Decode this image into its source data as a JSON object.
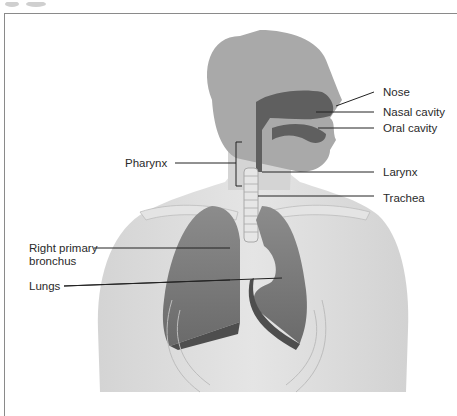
{
  "diagram": {
    "title": "",
    "labels": {
      "nose": "Nose",
      "nasal_cavity": "Nasal cavity",
      "oral_cavity": "Oral cavity",
      "pharynx": "Pharynx",
      "larynx": "Larynx",
      "trachea": "Trachea",
      "right_primary_bronchus_line1": "Right primary",
      "right_primary_bronchus_line2": "bronchus",
      "lungs": "Lungs"
    },
    "colors": {
      "body": "#d9d9d9",
      "head": "#a9a9a9",
      "cavity": "#5f5f5f",
      "lung": "#7d7d7d",
      "lung_dark": "#4e4e4e",
      "leader_line": "#222222"
    }
  }
}
